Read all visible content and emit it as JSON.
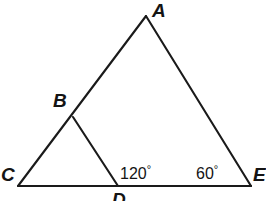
{
  "figure": {
    "background_color": "#ffffff",
    "stroke_color": "#1a1a1a",
    "stroke_width": 2.1,
    "width": 266,
    "height": 201
  },
  "vertices": [
    {
      "id": "A",
      "label": "A",
      "x": 146,
      "y": 16
    },
    {
      "id": "B",
      "label": "B",
      "x": 73,
      "y": 117
    },
    {
      "id": "C",
      "label": "C",
      "x": 18,
      "y": 186
    },
    {
      "id": "D",
      "label": "D",
      "x": 118,
      "y": 186
    },
    {
      "id": "E",
      "label": "E",
      "x": 251,
      "y": 186
    }
  ],
  "segments": [
    {
      "id": "CA",
      "from": "C",
      "to": "A",
      "x1": 18,
      "y1": 186,
      "x2": 146,
      "y2": 16
    },
    {
      "id": "AE",
      "from": "A",
      "to": "E",
      "x1": 146,
      "y1": 16,
      "x2": 251,
      "y2": 186
    },
    {
      "id": "CE",
      "from": "C",
      "to": "E",
      "x1": 18,
      "y1": 186,
      "x2": 251,
      "y2": 186
    },
    {
      "id": "BD",
      "from": "B",
      "to": "D",
      "x1": 73,
      "y1": 117,
      "x2": 118,
      "y2": 186
    }
  ],
  "angles": [
    {
      "id": "angle-D",
      "at_vertex": "D",
      "value": "120",
      "degree_symbol": "°",
      "text": "120°"
    },
    {
      "id": "angle-E",
      "at_vertex": "E",
      "value": "60",
      "degree_symbol": "°",
      "text": "60°"
    }
  ],
  "labels": {
    "A": "A",
    "B": "B",
    "C": "C",
    "D": "D",
    "E": "E",
    "angle_D": "120",
    "angle_E": "60",
    "degree": "°"
  }
}
